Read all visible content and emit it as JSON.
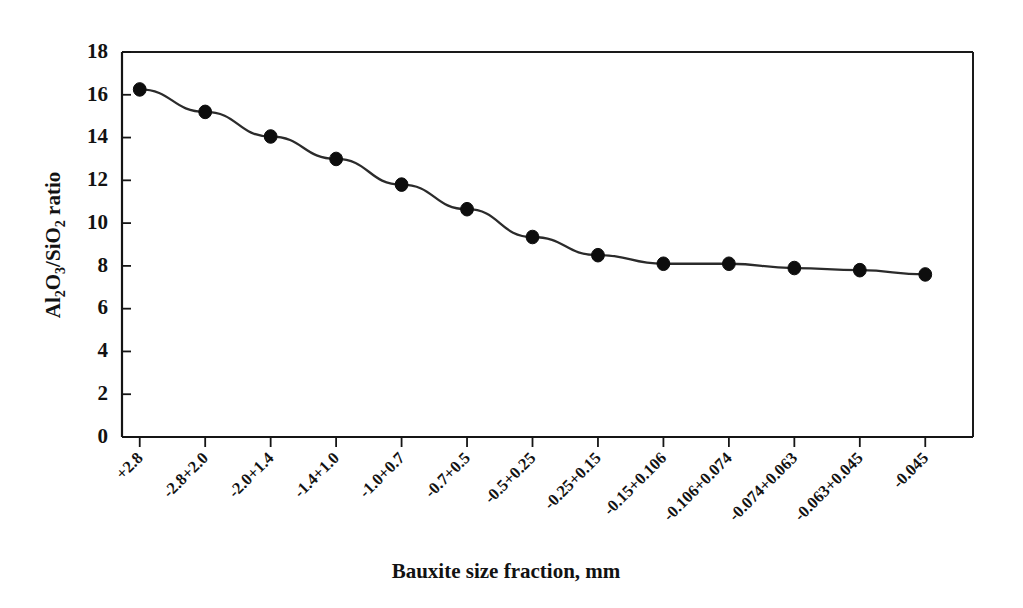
{
  "figure": {
    "background_color": "#ffffff",
    "ink_color": "#121212",
    "line_color": "#2b2b2b",
    "marker_color": "#0d0d0d"
  },
  "axis_titles": {
    "y_full": "Al2O3/SiO2 ratio",
    "y_parts": {
      "a": "Al",
      "a_sub": "2",
      "b": "O",
      "b_sub": "3",
      "slash": "/SiO",
      "c_sub": "2",
      "tail": " ratio"
    },
    "x": "Bauxite  size fraction, mm"
  },
  "y_ticks": [
    "0",
    "2",
    "4",
    "6",
    "8",
    "10",
    "12",
    "14",
    "16",
    "18"
  ],
  "chart_data": {
    "type": "line",
    "title": "",
    "subtitle": "",
    "xlabel": "Bauxite  size fraction, mm",
    "ylabel": "Al2O3/SiO2 ratio",
    "ylim": [
      0,
      18
    ],
    "ytick_step": 2,
    "grid": false,
    "legend": false,
    "legend_position": "none",
    "marker": "filled-circle",
    "categories": [
      "+2.8",
      "-2.8+2.0",
      "-2.0+1.4",
      "-1.4+1.0",
      "-1.0+0.7",
      "-0.7+0.5",
      "-0.5+0.25",
      "-0.25+0.15",
      "-0.15+0.106",
      "-0.106+0.074",
      "-0.074+0.063",
      "-0.063+0.045",
      "-0.045"
    ],
    "values": [
      16.25,
      15.2,
      14.05,
      13.0,
      11.8,
      10.65,
      9.35,
      8.5,
      8.1,
      8.1,
      7.9,
      7.8,
      7.6
    ],
    "series": [
      {
        "name": "Al2O3/SiO2 ratio",
        "values": [
          16.25,
          15.2,
          14.05,
          13.0,
          11.8,
          10.65,
          9.35,
          8.5,
          8.1,
          8.1,
          7.9,
          7.8,
          7.6
        ]
      }
    ]
  }
}
